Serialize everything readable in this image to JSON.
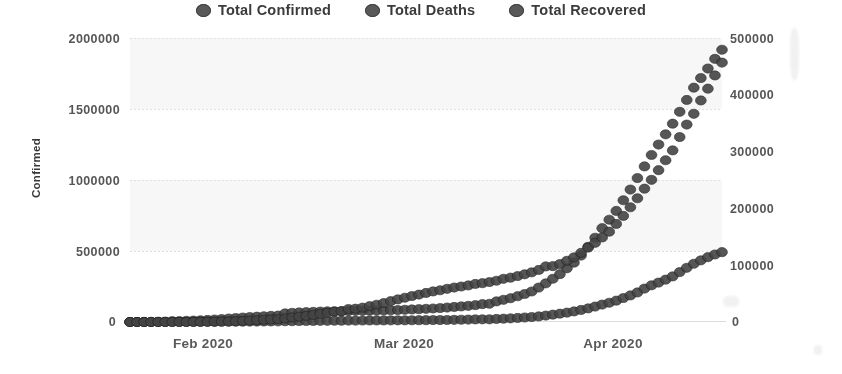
{
  "chart_data": {
    "type": "line",
    "title": "",
    "subtitle": "",
    "xlabel": "",
    "ylabel": "Confirmed",
    "y2label": "Deaths / Recovered",
    "grid": true,
    "legend_position": "top-center",
    "xlim": [
      "2020-01-22",
      "2020-04-21"
    ],
    "ylim": [
      0,
      2000000
    ],
    "y2lim": [
      0,
      500000
    ],
    "x_tick_labels": [
      "Feb 2020",
      "Mar 2020",
      "Apr 2020"
    ],
    "y_tick_labels": [
      "0",
      "500000",
      "1000000",
      "1500000",
      "2000000"
    ],
    "y_tick_values": [
      0,
      500000,
      1000000,
      1500000,
      2000000
    ],
    "y2_tick_labels": [
      "0",
      "100000",
      "200000",
      "300000",
      "400000",
      "500000"
    ],
    "y2_tick_values": [
      0,
      100000,
      200000,
      300000,
      400000,
      500000
    ],
    "marker": "circle",
    "marker_color": "#454545",
    "series": [
      {
        "name": "Total Confirmed",
        "axis": "left",
        "color": "#454545",
        "values": [
          555,
          654,
          941,
          1434,
          2118,
          2927,
          5578,
          6166,
          8234,
          9927,
          12038,
          14551,
          17391,
          20630,
          24554,
          28276,
          31439,
          34875,
          37552,
          40553,
          43099,
          45134,
          60328,
          64543,
          67100,
          69265,
          71332,
          73261,
          75138,
          75641,
          76199,
          76843,
          78599,
          78985,
          79570,
          80415,
          81397,
          82756,
          84120,
          86012,
          88371,
          90306,
          92840,
          95122,
          97886,
          101802,
          105836,
          109825,
          113590,
          118620,
          125875,
          128352,
          145205,
          156101,
          167454,
          181574,
          197168,
          214910,
          242708,
          272166,
          304528,
          337022,
          378287,
          418045,
          467594,
          529591,
          593291,
          660706,
          720117,
          782365,
          857487,
          932605,
          1013466,
          1095917,
          1176100,
          1249740,
          1321464,
          1396415,
          1480201,
          1563857,
          1650210,
          1717764,
          1784977,
          1853155,
          1917320
        ]
      },
      {
        "name": "Total Deaths",
        "axis": "right",
        "color": "#454545",
        "values": [
          17,
          18,
          26,
          42,
          56,
          82,
          131,
          133,
          171,
          213,
          259,
          305,
          362,
          426,
          492,
          564,
          634,
          719,
          806,
          906,
          1013,
          1113,
          1371,
          1523,
          1666,
          1770,
          1868,
          2007,
          2122,
          2247,
          2251,
          2458,
          2469,
          2629,
          2708,
          2770,
          2814,
          2872,
          2941,
          2996,
          3085,
          3160,
          3254,
          3348,
          3460,
          3558,
          3802,
          3988,
          4262,
          4615,
          4720,
          4735,
          5404,
          5819,
          6440,
          7126,
          7905,
          8733,
          9867,
          11299,
          12973,
          14652,
          16505,
          18625,
          21181,
          23970,
          27198,
          30652,
          33925,
          37582,
          42107,
          46809,
          51991,
          58787,
          64606,
          69374,
          74565,
          80304,
          87816,
          95455,
          102525,
          108503,
          114091,
          118854,
          123010
        ]
      },
      {
        "name": "Total Recovered",
        "axis": "right",
        "color": "#454545",
        "values": [
          28,
          30,
          36,
          39,
          52,
          61,
          107,
          126,
          143,
          222,
          284,
          472,
          623,
          852,
          1124,
          1487,
          2011,
          2616,
          3244,
          3946,
          4683,
          5150,
          6295,
          8058,
          9395,
          10865,
          12583,
          14352,
          16121,
          18177,
          18890,
          22886,
          23394,
          25227,
          27905,
          30384,
          33277,
          36711,
          39782,
          42716,
          45602,
          48228,
          51170,
          53796,
          55865,
          58358,
          60694,
          62494,
          64404,
          67003,
          68324,
          70251,
          72624,
          76034,
          78088,
          80840,
          84002,
          87403,
          91692,
          97875,
          98334,
          102020,
          107771,
          113787,
          121653,
          130915,
          139415,
          148879,
          159011,
          172692,
          186834,
          202032,
          217839,
          234695,
          250289,
          267325,
          284802,
          302135,
          325544,
          347587,
          366587,
          390011,
          410800,
          434045,
          456651
        ]
      }
    ]
  },
  "legend": {
    "items": [
      {
        "label": "Total Confirmed",
        "marker": "circle-marker"
      },
      {
        "label": "Total Deaths",
        "marker": "circle-marker"
      },
      {
        "label": "Total Recovered",
        "marker": "circle-marker"
      }
    ]
  },
  "axes": {
    "left": {
      "title": "Confirmed",
      "ticks": [
        "2000000",
        "1500000",
        "1000000",
        "500000",
        "0"
      ]
    },
    "right": {
      "title": "Deaths / Recovered",
      "ticks": [
        "500000",
        "400000",
        "300000",
        "200000",
        "100000",
        "0"
      ]
    },
    "bottom": {
      "ticks": [
        "Feb 2020",
        "Mar 2020",
        "Apr 2020"
      ]
    }
  },
  "colors": {
    "marker": "#454545",
    "marker_edge": "#1d1d1d",
    "grid": "#e8eaec",
    "text": "#4a4a4a",
    "background": "#ffffff"
  }
}
